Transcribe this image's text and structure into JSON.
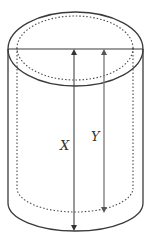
{
  "diagram": {
    "colors": {
      "outline": "#3a3a3a",
      "dotted": "#4a4a4a",
      "arrow_x": "#444444",
      "arrow_y": "#777777",
      "background": "#ffffff"
    },
    "labels": {
      "x": "X",
      "y": "Y"
    }
  }
}
